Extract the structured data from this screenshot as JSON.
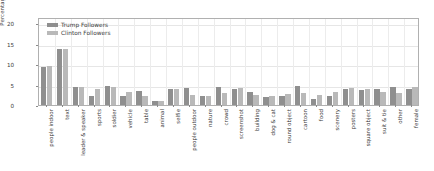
{
  "chart_data": {
    "type": "bar",
    "title": "",
    "xlabel": "",
    "ylabel": "Percentage",
    "ylim": [
      0,
      21.5
    ],
    "yticks": [
      0,
      5,
      10,
      15,
      20
    ],
    "grid": true,
    "legend_position": "upper left",
    "categories": [
      "people indoor",
      "text",
      "leader & speaker",
      "sports",
      "soldier",
      "vehicle",
      "table",
      "animal",
      "selfie",
      "people outdoor",
      "nature",
      "crowd",
      "screenshot",
      "building",
      "dog & cat",
      "round object",
      "cartoon",
      "food",
      "scenery",
      "posters",
      "square object",
      "suit & tie",
      "other",
      "female"
    ],
    "series": [
      {
        "name": "Trump Followers",
        "color": "#8f8f8f",
        "values": [
          9.2,
          13.6,
          4.3,
          2.1,
          4.6,
          2.2,
          3.5,
          1.1,
          4.0,
          4.2,
          2.1,
          4.3,
          3.9,
          3.2,
          1.9,
          2.2,
          4.6,
          1.5,
          2.3,
          4.0,
          3.6,
          3.8,
          4.5,
          4.0
        ]
      },
      {
        "name": "Clinton Followers",
        "color": "#b9b9b9",
        "values": [
          9.6,
          13.8,
          4.4,
          3.9,
          4.4,
          3.1,
          2.2,
          1.1,
          3.9,
          2.5,
          2.1,
          3.0,
          4.1,
          2.4,
          2.2,
          2.6,
          3.0,
          2.4,
          3.3,
          4.2,
          4.0,
          3.2,
          3.0,
          4.4
        ]
      }
    ]
  },
  "legend": {
    "items": [
      {
        "label": "Trump Followers",
        "swatch": "t"
      },
      {
        "label": "Clinton Followers",
        "swatch": "c"
      }
    ]
  },
  "axis": {
    "y_label": "Percentage"
  }
}
